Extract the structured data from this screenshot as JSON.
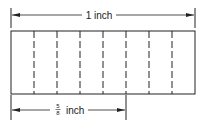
{
  "diagram": {
    "top_dimension": {
      "label": "1 inch"
    },
    "bottom_dimension": {
      "numerator": "5",
      "denominator": "8",
      "unit": "inch"
    },
    "strip": {
      "divisions": 8,
      "highlighted_parts": 5
    },
    "colors": {
      "line": "#222222",
      "background": "#ffffff"
    }
  }
}
